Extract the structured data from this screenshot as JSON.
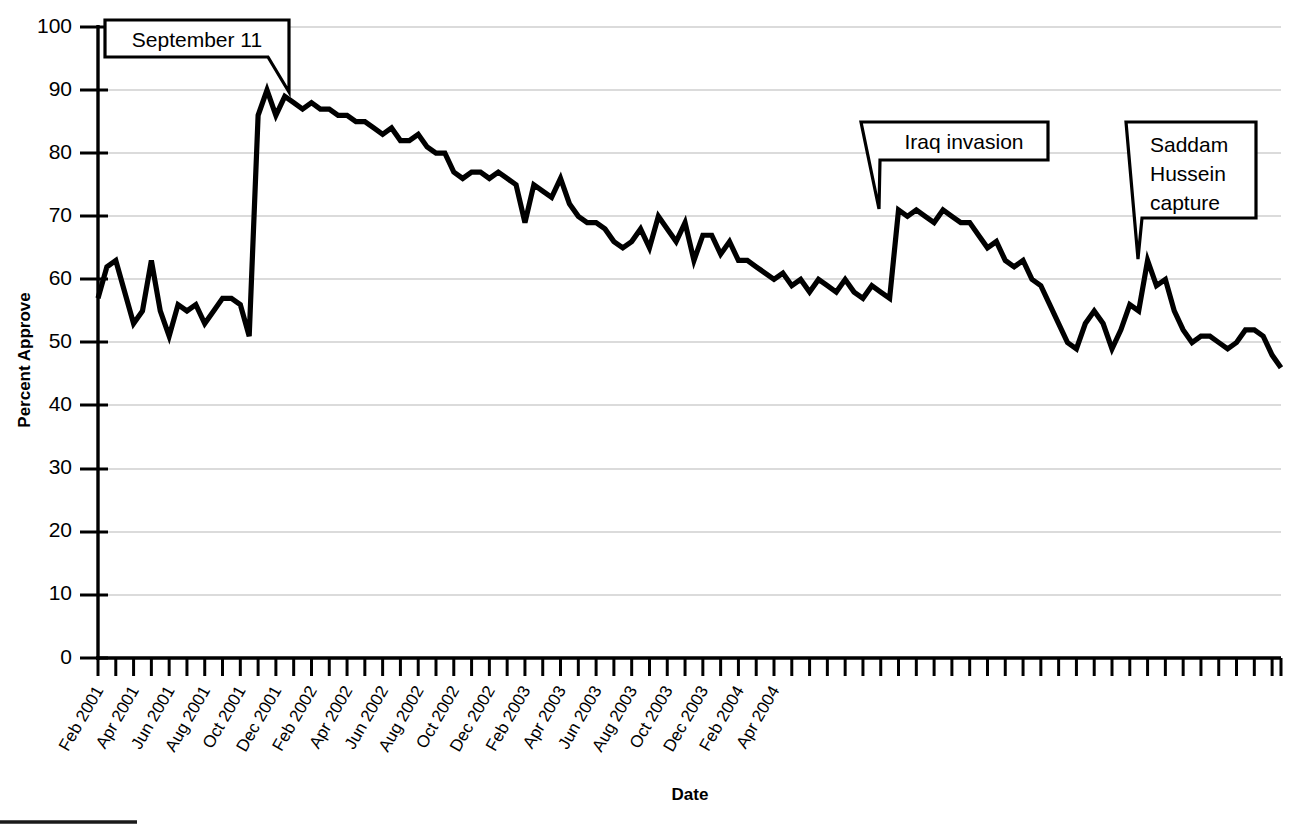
{
  "chart_data": {
    "type": "line",
    "title": "",
    "xlabel": "Date",
    "ylabel": "Percent Approve",
    "ylim": [
      0,
      100
    ],
    "ytick_values": [
      0,
      10,
      20,
      30,
      40,
      50,
      60,
      70,
      80,
      90,
      100
    ],
    "ytick_labels": [
      "0",
      "10",
      "20",
      "30",
      "40",
      "50",
      "60",
      "70",
      "80",
      "90",
      "100"
    ],
    "grid": "horizontal",
    "legend": "none",
    "xtick_labels": [
      "Feb 2001",
      "Apr 2001",
      "Jun 2001",
      "Aug 2001",
      "Oct 2001",
      "Dec 2001",
      "Feb 2002",
      "Apr 2002",
      "Jun 2002",
      "Aug 2002",
      "Oct 2002",
      "Dec 2002",
      "Feb 2003",
      "Apr 2003",
      "Jun 2003",
      "Aug 2003",
      "Oct 2003",
      "Dec 2003",
      "Feb 2004",
      "Apr 2004"
    ],
    "x_range_label": "Feb 2001 to Jun 2004",
    "series": [
      {
        "name": "Presidential approval",
        "values": [
          57,
          62,
          63,
          58,
          53,
          55,
          63,
          55,
          51,
          56,
          55,
          56,
          53,
          55,
          57,
          57,
          56,
          51,
          86,
          90,
          86,
          89,
          88,
          87,
          88,
          87,
          87,
          86,
          86,
          85,
          85,
          84,
          83,
          84,
          82,
          82,
          83,
          81,
          80,
          80,
          77,
          76,
          77,
          77,
          76,
          77,
          76,
          75,
          69,
          75,
          74,
          73,
          76,
          72,
          70,
          69,
          69,
          68,
          66,
          65,
          66,
          68,
          65,
          70,
          68,
          66,
          69,
          63,
          67,
          67,
          64,
          66,
          63,
          63,
          62,
          61,
          60,
          61,
          59,
          60,
          58,
          60,
          59,
          58,
          60,
          58,
          57,
          59,
          58,
          57,
          71,
          70,
          71,
          70,
          69,
          71,
          70,
          69,
          69,
          67,
          65,
          66,
          63,
          62,
          63,
          60,
          59,
          56,
          53,
          50,
          49,
          53,
          55,
          53,
          49,
          52,
          56,
          55,
          63,
          59,
          60,
          55,
          52,
          50,
          51,
          51,
          50,
          49,
          50,
          52,
          52,
          51,
          48,
          46
        ]
      }
    ],
    "annotations": [
      {
        "label": "September 11",
        "text_lines": [
          "September 11"
        ],
        "value": 90,
        "date": "Sep 2001"
      },
      {
        "label": "Iraq invasion",
        "text_lines": [
          "Iraq invasion"
        ],
        "value": 71,
        "date": "Mar 2003"
      },
      {
        "label": "Saddam Hussein capture",
        "text_lines": [
          "Saddam",
          "Hussein",
          "capture"
        ],
        "value": 63,
        "date": "Dec 2003"
      }
    ],
    "colors": {
      "line": "#000000",
      "grid": "#cfcfcf",
      "axis": "#000000",
      "background": "#ffffff"
    }
  },
  "axes": {
    "y_title": "Percent Approve",
    "x_title": "Date"
  }
}
